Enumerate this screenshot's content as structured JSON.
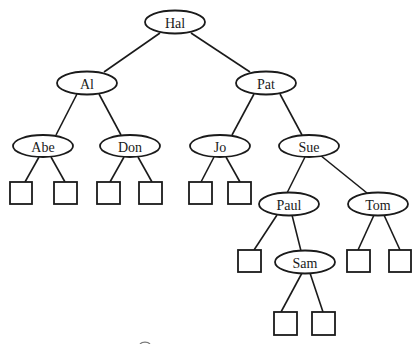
{
  "diagram": {
    "type": "binary-search-tree",
    "nodes": [
      {
        "id": "hal",
        "label": "Hal",
        "cx": 175,
        "cy": 22
      },
      {
        "id": "al",
        "label": "Al",
        "cx": 87,
        "cy": 83
      },
      {
        "id": "pat",
        "label": "Pat",
        "cx": 266,
        "cy": 83
      },
      {
        "id": "abe",
        "label": "Abe",
        "cx": 43,
        "cy": 146
      },
      {
        "id": "don",
        "label": "Don",
        "cx": 130,
        "cy": 146
      },
      {
        "id": "jo",
        "label": "Jo",
        "cx": 220,
        "cy": 146
      },
      {
        "id": "sue",
        "label": "Sue",
        "cx": 309,
        "cy": 146
      },
      {
        "id": "paul",
        "label": "Paul",
        "cx": 289,
        "cy": 204
      },
      {
        "id": "tom",
        "label": "Tom",
        "cx": 378,
        "cy": 204
      },
      {
        "id": "sam",
        "label": "Sam",
        "cx": 305,
        "cy": 262
      }
    ],
    "edges": [
      [
        "hal",
        "al"
      ],
      [
        "hal",
        "pat"
      ],
      [
        "al",
        "abe"
      ],
      [
        "al",
        "don"
      ],
      [
        "pat",
        "jo"
      ],
      [
        "pat",
        "sue"
      ],
      [
        "sue",
        "paul"
      ],
      [
        "sue",
        "tom"
      ],
      [
        "paul",
        "sam"
      ]
    ],
    "leaf_count": 11
  }
}
